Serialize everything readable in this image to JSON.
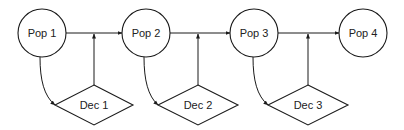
{
  "diagram": {
    "type": "flow",
    "populations": [
      {
        "id": "pop1",
        "label": "Pop 1",
        "cx": 42,
        "cy": 33,
        "r": 24
      },
      {
        "id": "pop2",
        "label": "Pop 2",
        "cx": 146,
        "cy": 33,
        "r": 24
      },
      {
        "id": "pop3",
        "label": "Pop 3",
        "cx": 254,
        "cy": 33,
        "r": 24
      },
      {
        "id": "pop4",
        "label": "Pop 4",
        "cx": 363,
        "cy": 33,
        "r": 24
      }
    ],
    "decisions": [
      {
        "id": "dec1",
        "label": "Dec 1",
        "cx": 94,
        "cy": 105,
        "hw": 39,
        "hh": 20
      },
      {
        "id": "dec2",
        "label": "Dec 2",
        "cx": 198,
        "cy": 105,
        "hw": 40,
        "hh": 20
      },
      {
        "id": "dec3",
        "label": "Dec 3",
        "cx": 308,
        "cy": 105,
        "hw": 40,
        "hh": 20
      }
    ],
    "edges": [
      {
        "from": "pop1",
        "to": "pop2",
        "kind": "transition"
      },
      {
        "from": "pop2",
        "to": "pop3",
        "kind": "transition"
      },
      {
        "from": "pop3",
        "to": "pop4",
        "kind": "transition"
      },
      {
        "from": "pop1",
        "to": "dec1",
        "kind": "curved"
      },
      {
        "from": "pop2",
        "to": "dec2",
        "kind": "curved"
      },
      {
        "from": "pop3",
        "to": "dec3",
        "kind": "curved"
      },
      {
        "from": "dec1",
        "to": "pop1-pop2",
        "kind": "vertical"
      },
      {
        "from": "dec2",
        "to": "pop2-pop3",
        "kind": "vertical"
      },
      {
        "from": "dec3",
        "to": "pop3-pop4",
        "kind": "vertical"
      }
    ]
  },
  "colors": {
    "stroke": "#1a1a1a",
    "fill": "#ffffff",
    "text": "#222222"
  }
}
